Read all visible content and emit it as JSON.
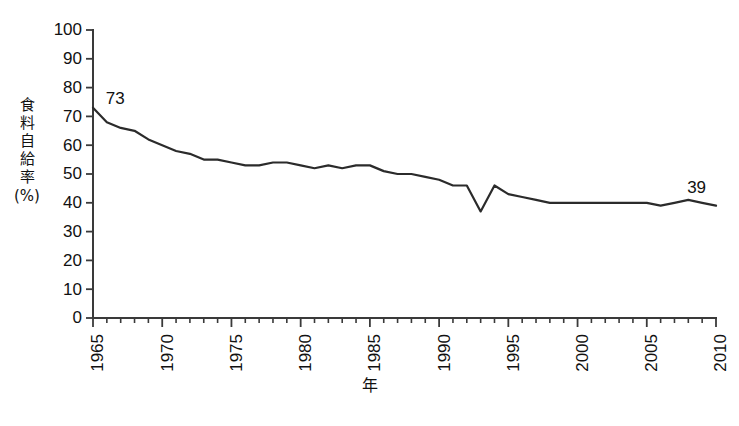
{
  "chart_data": {
    "type": "line",
    "title": "",
    "subtitle": "",
    "xlabel": "年",
    "ylabel": "食料自給率（%）",
    "ylabel_chars": [
      "食",
      "料",
      "自",
      "給",
      "率"
    ],
    "ylabel_unit": "(%)",
    "xlim": [
      1965,
      2010
    ],
    "ylim": [
      0,
      100
    ],
    "grid": false,
    "legend": false,
    "legend_position": "none",
    "line_color": "#2b2b2b",
    "axis_color": "#3a3a3a",
    "background_color": "#ffffff",
    "y_ticks": [
      0,
      10,
      20,
      30,
      40,
      50,
      60,
      70,
      80,
      90,
      100
    ],
    "y_tick_labels": [
      "0",
      "10",
      "20",
      "30",
      "40",
      "50",
      "60",
      "70",
      "80",
      "90",
      "100"
    ],
    "x_ticks_major": [
      1965,
      1970,
      1975,
      1980,
      1985,
      1990,
      1995,
      2000,
      2005,
      2010
    ],
    "x_tick_labels": [
      "1965",
      "1970",
      "1975",
      "1980",
      "1985",
      "1990",
      "1995",
      "2000",
      "2005",
      "2010"
    ],
    "x_tick_interval_minor": 1,
    "x": [
      1965,
      1966,
      1967,
      1968,
      1969,
      1970,
      1971,
      1972,
      1973,
      1974,
      1975,
      1976,
      1977,
      1978,
      1979,
      1980,
      1981,
      1982,
      1983,
      1984,
      1985,
      1986,
      1987,
      1988,
      1989,
      1990,
      1991,
      1992,
      1993,
      1994,
      1995,
      1996,
      1997,
      1998,
      1999,
      2000,
      2001,
      2002,
      2003,
      2004,
      2005,
      2006,
      2007,
      2008,
      2009,
      2010
    ],
    "values": [
      73,
      68,
      66,
      65,
      62,
      60,
      58,
      57,
      55,
      55,
      54,
      53,
      53,
      54,
      54,
      53,
      52,
      53,
      52,
      53,
      53,
      51,
      50,
      50,
      49,
      48,
      46,
      46,
      37,
      46,
      43,
      42,
      41,
      40,
      40,
      40,
      40,
      40,
      40,
      40,
      40,
      39,
      40,
      41,
      40,
      39
    ],
    "series": [
      {
        "name": "食料自給率",
        "values": [
          73,
          68,
          66,
          65,
          62,
          60,
          58,
          57,
          55,
          55,
          54,
          53,
          53,
          54,
          54,
          53,
          52,
          53,
          52,
          53,
          53,
          51,
          50,
          50,
          49,
          48,
          46,
          46,
          37,
          46,
          43,
          42,
          41,
          40,
          40,
          40,
          40,
          40,
          40,
          40,
          40,
          39,
          40,
          41,
          40,
          39
        ]
      }
    ],
    "annotations": [
      {
        "id": "start-value",
        "text": "73",
        "x": 1966.6,
        "y": 76,
        "value": 73,
        "at_year": 1965
      },
      {
        "id": "end-value",
        "text": "39",
        "x": 2008.6,
        "y": 45,
        "value": 39,
        "at_year": 2010
      }
    ]
  }
}
